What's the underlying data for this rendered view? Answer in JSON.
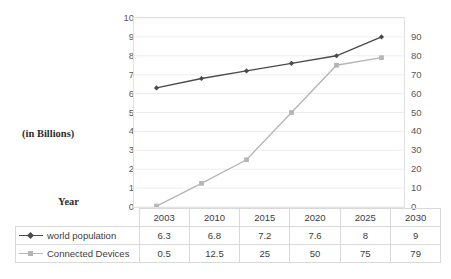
{
  "captions": {
    "y_axis_caption": "(in Billions)",
    "x_axis_caption": "Year"
  },
  "chart_data": {
    "type": "line",
    "title": "",
    "xlabel": "Year",
    "ylabel": "(in Billions)",
    "categories": [
      "2003",
      "2010",
      "2015",
      "2020",
      "2025",
      "2030"
    ],
    "series": [
      {
        "name": "world population",
        "axis": "left",
        "values": [
          6.3,
          6.8,
          7.2,
          7.6,
          8,
          9
        ],
        "value_labels": [
          "6.3",
          "6.8",
          "7.2",
          "7.6",
          "8",
          "9"
        ],
        "color": "#4a4a4a",
        "marker": "diamond"
      },
      {
        "name": "Connected Devices",
        "axis": "right",
        "values": [
          0.5,
          12.5,
          25,
          50,
          75,
          79
        ],
        "value_labels": [
          "0.5",
          "12.5",
          "25",
          "50",
          "75",
          "79"
        ],
        "color": "#b6b6b6",
        "marker": "square"
      }
    ],
    "y_left": {
      "ticks": [
        "10",
        "9",
        "8",
        "7",
        "6",
        "5",
        "4",
        "3",
        "2",
        "1",
        "0"
      ],
      "min": 0,
      "max": 10,
      "step": 1
    },
    "y_right": {
      "ticks": [
        "90",
        "80",
        "70",
        "60",
        "50",
        "40",
        "30",
        "20",
        "10",
        "0"
      ],
      "min": 0,
      "max": 90,
      "step": 10
    },
    "grid": true,
    "legend_position": "table-below"
  },
  "table": {
    "year_row_label": "",
    "rows": [
      {
        "label": "world population",
        "values": [
          "6.3",
          "6.8",
          "7.2",
          "7.6",
          "8",
          "9"
        ]
      },
      {
        "label": "Connected Devices",
        "values": [
          "0.5",
          "12.5",
          "25",
          "50",
          "75",
          "79"
        ]
      }
    ]
  },
  "colors": {
    "population_line": "#4a4a4a",
    "devices_line": "#b6b6b6",
    "gridline": "#ededed",
    "plot_border": "#e2e2e2",
    "table_border": "#d9d9d9"
  }
}
